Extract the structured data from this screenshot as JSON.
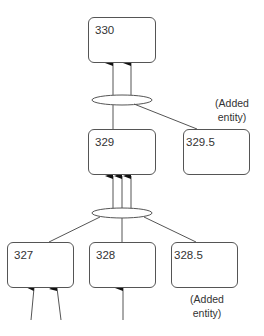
{
  "diagram": {
    "type": "aggregation-tree",
    "nodes": [
      {
        "id": "330",
        "label": "330"
      },
      {
        "id": "329",
        "label": "329"
      },
      {
        "id": "329.5",
        "label": "329.5",
        "note": "(Added entity)"
      },
      {
        "id": "327",
        "label": "327"
      },
      {
        "id": "328",
        "label": "328"
      },
      {
        "id": "328.5",
        "label": "328.5",
        "note": "(Added entity)"
      }
    ],
    "notes": {
      "upper": {
        "line1": "(Added",
        "line2": "entity)"
      },
      "lower": {
        "line1": "(Added",
        "line2": "entity)"
      }
    },
    "edges": [
      {
        "from": "329",
        "to": "330",
        "via": "ellipse-top",
        "arrows": 2
      },
      {
        "from": "329.5",
        "to": "330",
        "via": "ellipse-top"
      },
      {
        "from": "327",
        "to": "329",
        "via": "ellipse-bottom",
        "arrows": 3
      },
      {
        "from": "328",
        "to": "329",
        "via": "ellipse-bottom"
      },
      {
        "from": "328.5",
        "to": "329",
        "via": "ellipse-bottom"
      },
      {
        "from": "external",
        "to": "327",
        "arrows": 2
      },
      {
        "from": "external",
        "to": "328",
        "arrows": 1
      }
    ],
    "colors": {
      "stroke": "#555555",
      "text": "#333333",
      "background": "#ffffff"
    }
  }
}
